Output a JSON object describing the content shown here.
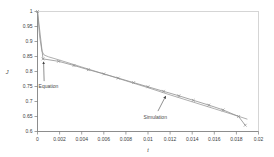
{
  "figure": {
    "background": "#ffffff"
  },
  "chart_data": {
    "type": "line",
    "title": "",
    "xlabel": "t",
    "ylabel": "J",
    "xlim": [
      0,
      0.02
    ],
    "ylim": [
      0.6,
      1.0
    ],
    "grid": false,
    "legend_position": "none",
    "x_ticks": [
      0,
      0.002,
      0.004,
      0.006,
      0.008,
      0.01,
      0.012,
      0.014,
      0.016,
      0.018,
      0.02
    ],
    "x_tick_labels": [
      "0",
      "0.002",
      "0.004",
      "0.006",
      "0.008",
      "0.01",
      "0.012",
      "0.014",
      "0.016",
      "0.018",
      "0.02"
    ],
    "y_ticks": [
      1,
      0.95,
      0.9,
      0.85,
      0.8,
      0.75,
      0.7,
      0.65,
      0.6
    ],
    "y_tick_labels": [
      "1",
      "0.95",
      "0.9",
      "0.85",
      "0.8",
      "0.75",
      "0.7",
      "0.65",
      "0.6"
    ],
    "series": [
      {
        "name": "Equation",
        "marker": "none",
        "color": "#9b9b9b",
        "points": [
          [
            0,
            1
          ],
          [
            0.0002,
            0.915
          ],
          [
            0.0004,
            0.868
          ],
          [
            0.0006,
            0.855
          ],
          [
            0.001,
            0.849
          ],
          [
            0.002,
            0.838
          ],
          [
            0.004,
            0.815
          ],
          [
            0.006,
            0.792
          ],
          [
            0.008,
            0.769
          ],
          [
            0.01,
            0.746
          ],
          [
            0.012,
            0.722
          ],
          [
            0.014,
            0.699
          ],
          [
            0.016,
            0.676
          ],
          [
            0.018,
            0.653
          ],
          [
            0.019,
            0.641
          ]
        ]
      },
      {
        "name": "Simulation",
        "marker": "x",
        "color": "#8f8f8f",
        "points": [
          [
            0,
            1
          ],
          [
            0.0005,
            0.842
          ],
          [
            0.0019,
            0.834
          ],
          [
            0.0033,
            0.82
          ],
          [
            0.0046,
            0.806
          ],
          [
            0.006,
            0.792
          ],
          [
            0.0073,
            0.778
          ],
          [
            0.0087,
            0.763
          ],
          [
            0.01,
            0.749
          ],
          [
            0.0114,
            0.734
          ],
          [
            0.0128,
            0.719
          ],
          [
            0.0141,
            0.704
          ],
          [
            0.0155,
            0.688
          ],
          [
            0.0168,
            0.672
          ],
          [
            0.0182,
            0.65
          ],
          [
            0.0188,
            0.621
          ]
        ]
      }
    ],
    "annotations": [
      {
        "text": "Equation",
        "text_x": 0.0001,
        "text_y": 0.752,
        "arrow_from_x": 0.0006,
        "arrow_from_y": 0.768,
        "arrow_to_x": 0.00055,
        "arrow_to_y": 0.832
      },
      {
        "text": "Simulation",
        "text_x": 0.0096,
        "text_y": 0.648,
        "arrow_from_x": 0.0109,
        "arrow_from_y": 0.668,
        "arrow_to_x": 0.0116,
        "arrow_to_y": 0.718
      }
    ],
    "colors": {
      "axis": "#7a7a7a",
      "border": "#c4c4c4",
      "tick_text": "#404040",
      "annotation_text": "#4a4a4a",
      "arrow": "#444444"
    }
  }
}
